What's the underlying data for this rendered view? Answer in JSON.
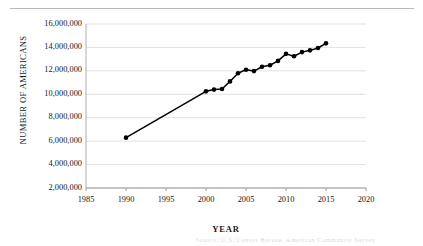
{
  "figure": {
    "has_top_rule": true,
    "faint_caption": "Source: U.S. Census Bureau, American Community Survey"
  },
  "chart_data": {
    "type": "line",
    "title": "",
    "xlabel": "YEAR",
    "ylabel": "NUMBER OF AMERICANS",
    "xlim": [
      1985,
      2020
    ],
    "ylim": [
      2000000,
      16000000
    ],
    "grid": "horizontal",
    "legend": "none",
    "marker": "filled-circle",
    "line_color": "#000000",
    "gridline_color": "#d9d9d9",
    "x_ticks": [
      1985,
      1990,
      1995,
      2000,
      2005,
      2010,
      2015,
      2020
    ],
    "x_tick_labels": [
      "1985",
      "1990",
      "1995",
      "2000",
      "2005",
      "2010",
      "2015",
      "2020"
    ],
    "y_ticks": [
      2000000,
      4000000,
      6000000,
      8000000,
      10000000,
      12000000,
      14000000,
      16000000
    ],
    "y_tick_labels": [
      "2,000,000",
      "4,000,000",
      "6,000,000",
      "8,000,000",
      "10,000,000",
      "12,000,000",
      "14,000,000",
      "16,000,000"
    ],
    "x": [
      1990,
      2000,
      2001,
      2002,
      2003,
      2004,
      2005,
      2006,
      2007,
      2008,
      2009,
      2010,
      2011,
      2012,
      2013,
      2014,
      2015
    ],
    "values": [
      6300000,
      10250000,
      10400000,
      10450000,
      11100000,
      11800000,
      12100000,
      11980000,
      12350000,
      12480000,
      12850000,
      13450000,
      13250000,
      13600000,
      13750000,
      13950000,
      14350000
    ],
    "series": [
      {
        "name": "Number of Americans",
        "values": [
          6300000,
          10250000,
          10400000,
          10450000,
          11100000,
          11800000,
          12100000,
          11980000,
          12350000,
          12480000,
          12850000,
          13450000,
          13250000,
          13600000,
          13750000,
          13950000,
          14350000
        ]
      }
    ]
  }
}
